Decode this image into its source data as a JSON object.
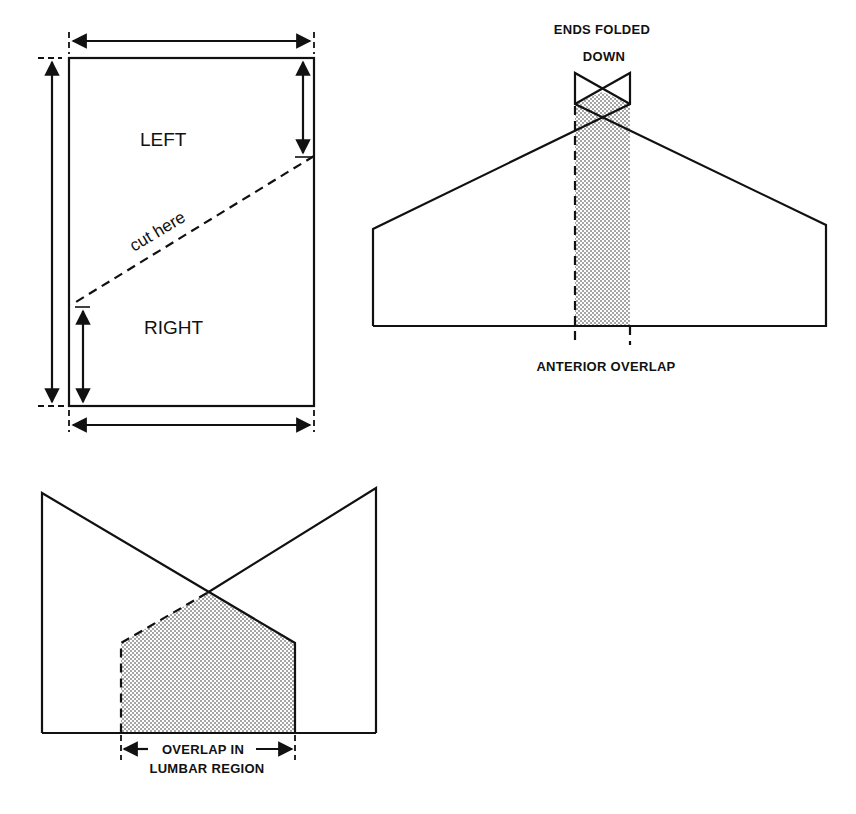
{
  "panels": {
    "rectangle": {
      "label_top": "LEFT",
      "label_bottom": "RIGHT",
      "cut_label": "cut here"
    },
    "anterior": {
      "label_top_line1": "ENDS FOLDED",
      "label_top_line2": "DOWN",
      "label_bottom": "ANTERIOR OVERLAP"
    },
    "lumbar": {
      "label_line1": "OVERLAP IN",
      "label_line2": "LUMBAR REGION"
    }
  },
  "colors": {
    "line": "#111111",
    "shade": "#9a9a9a",
    "background": "#ffffff"
  }
}
